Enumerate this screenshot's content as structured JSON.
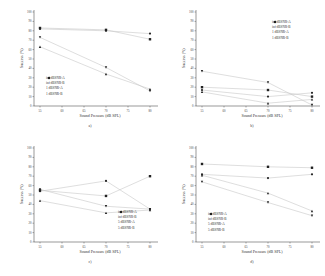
{
  "chart_data": [
    {
      "type": "scatter",
      "panel": "a",
      "caption": "a)",
      "title": "",
      "xlabel": "Sound Pressure (dB SPL)",
      "ylabel": "Success (%)",
      "x": [
        55,
        70,
        80
      ],
      "xticks": [
        55,
        60,
        65,
        70,
        75,
        80
      ],
      "ylim": [
        0,
        100
      ],
      "yticks": [
        0,
        10,
        20,
        30,
        40,
        50,
        60,
        70,
        80,
        90,
        100
      ],
      "legend_position": "lower left",
      "series": [
        {
          "name": "inf dBSNR-A",
          "marker": "square",
          "values": [
            83,
            81,
            71
          ]
        },
        {
          "name": "inf dBSNR-B",
          "marker": "circle",
          "values": [
            82,
            80,
            77
          ]
        },
        {
          "name": "1 dBSNR-A",
          "marker": "triangle-up",
          "values": [
            63,
            34,
            18
          ]
        },
        {
          "name": "1 dBSNR-B",
          "marker": "triangle-down",
          "values": [
            73,
            41,
            16
          ]
        }
      ]
    },
    {
      "type": "scatter",
      "panel": "b",
      "caption": "b)",
      "title": "",
      "xlabel": "Sound Pressure (dB SPL)",
      "ylabel": "Success (%)",
      "x": [
        55,
        70,
        80
      ],
      "xticks": [
        55,
        60,
        65,
        70,
        75,
        80
      ],
      "ylim": [
        0,
        100
      ],
      "yticks": [
        0,
        10,
        20,
        30,
        40,
        50,
        60,
        70,
        80,
        90,
        100
      ],
      "legend_position": "upper right",
      "series": [
        {
          "name": "inf dBSNR-A",
          "marker": "square",
          "values": [
            20,
            17,
            10
          ]
        },
        {
          "name": "inf dBSNR-B",
          "marker": "circle",
          "values": [
            17,
            10,
            14
          ]
        },
        {
          "name": "1 dBSNR-A",
          "marker": "triangle-up",
          "values": [
            15,
            3,
            7
          ]
        },
        {
          "name": "1 dBSNR-B",
          "marker": "triangle-down",
          "values": [
            37,
            25,
            1
          ]
        }
      ]
    },
    {
      "type": "scatter",
      "panel": "c",
      "caption": "c)",
      "title": "",
      "xlabel": "Sound Pressure (dB SPL)",
      "ylabel": "Success (%)",
      "x": [
        55,
        70,
        80
      ],
      "xticks": [
        55,
        60,
        65,
        70,
        75,
        80
      ],
      "ylim": [
        0,
        100
      ],
      "yticks": [
        0,
        10,
        20,
        30,
        40,
        50,
        60,
        70,
        80,
        90,
        100
      ],
      "legend_position": "lower right",
      "series": [
        {
          "name": "inf dBSNR-A",
          "marker": "square",
          "values": [
            55,
            49,
            70
          ]
        },
        {
          "name": "inf dBSNR-B",
          "marker": "circle",
          "values": [
            54,
            65,
            35
          ]
        },
        {
          "name": "5 dBSNR-A",
          "marker": "triangle-up",
          "values": [
            44,
            31,
            34
          ]
        },
        {
          "name": "5 dBSNR-B",
          "marker": "triangle-down",
          "values": [
            56,
            38,
            35
          ]
        }
      ]
    },
    {
      "type": "scatter",
      "panel": "d",
      "caption": "d)",
      "title": "",
      "xlabel": "Sound Pressure (dB SPL)",
      "ylabel": "Success (%)",
      "x": [
        55,
        70,
        80
      ],
      "xticks": [
        55,
        60,
        65,
        70,
        75,
        80
      ],
      "ylim": [
        0,
        100
      ],
      "yticks": [
        0,
        10,
        20,
        30,
        40,
        50,
        60,
        70,
        80,
        90,
        100
      ],
      "legend_position": "lower left",
      "series": [
        {
          "name": "inf dBSNR-A",
          "marker": "square",
          "values": [
            83,
            80,
            79
          ]
        },
        {
          "name": "inf dBSNR-B",
          "marker": "circle",
          "values": [
            72,
            68,
            72
          ]
        },
        {
          "name": "5 dBSNR-A",
          "marker": "triangle-up",
          "values": [
            71,
            52,
            33
          ]
        },
        {
          "name": "5 dBSNR-B",
          "marker": "triangle-down",
          "values": [
            64,
            42,
            28
          ]
        }
      ]
    }
  ],
  "style": {
    "marker_color": "#222222",
    "line_color": "#c8c8c8",
    "axis_color": "#333333"
  }
}
